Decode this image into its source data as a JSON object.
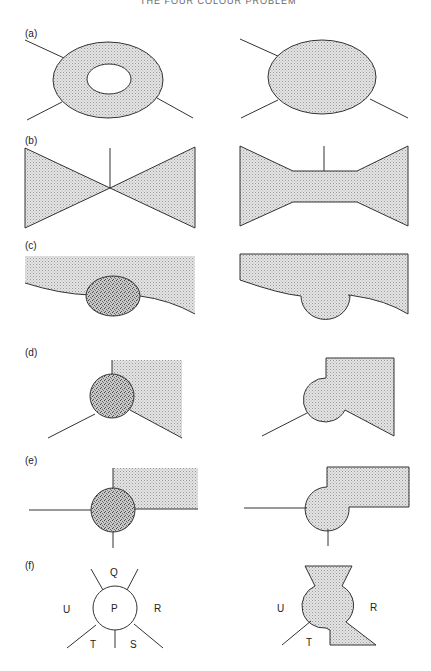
{
  "header": {
    "title": "THE FOUR COLOUR PROBLEM"
  },
  "panels": [
    {
      "id": "a",
      "label": "(a)",
      "description": "Ring-shaped shaded country with four boundary edges; reduced to a solid shaded ellipse"
    },
    {
      "id": "b",
      "label": "(b)",
      "description": "Two shaded wedge regions meeting at a point with a vertical edge; joined by a shaded bridge"
    },
    {
      "id": "c",
      "label": "(c)",
      "description": "Dark stippled oval country on boundary of shaded region; merged as a bulge"
    },
    {
      "id": "d",
      "label": "(d)",
      "description": "Dark stippled circle at junction of three edges; merged into shaded region"
    },
    {
      "id": "e",
      "label": "(e)",
      "description": "Dark stippled circle at junction of four edges; merged into shaded region"
    },
    {
      "id": "f",
      "label": "(f)",
      "description": "Pentagonal country P surrounded by Q, R, S, T, U; merged with Q and S",
      "left_regions": {
        "center": "P",
        "top": "Q",
        "left": "U",
        "right": "R",
        "bottom_left": "T",
        "bottom_right": "S"
      },
      "right_regions": {
        "left": "U",
        "right": "R",
        "bottom_left": "T"
      }
    }
  ],
  "colors": {
    "shade": "#d6d6d6",
    "dark_stipple": "#a8a8a8",
    "stroke": "#333333"
  }
}
